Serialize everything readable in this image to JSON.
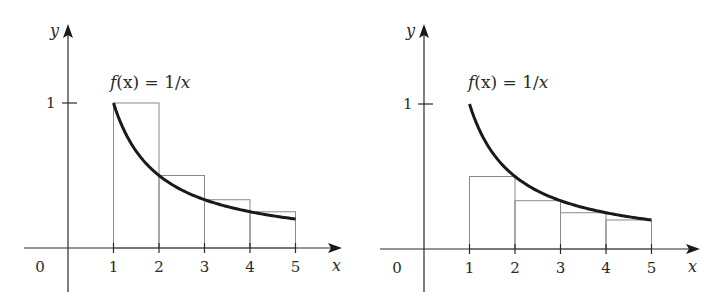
{
  "chart_data": [
    {
      "type": "line",
      "title": "",
      "function_label": "f(x) = 1/x",
      "function_label_parts": {
        "f": "f",
        "arg": "(x)",
        "eq": " = ",
        "rhs_num": "1/",
        "rhs_var": "x"
      },
      "xlabel": "x",
      "ylabel": "y",
      "x_ticks": [
        "0",
        "1",
        "2",
        "3",
        "4",
        "5"
      ],
      "y_ticks": [
        "1"
      ],
      "xlim": [
        -0.5,
        5.8
      ],
      "ylim": [
        -0.3,
        1.35
      ],
      "grid": false,
      "series": [
        {
          "name": "f(x) = 1/x",
          "x": [
            1,
            1.5,
            2,
            2.5,
            3,
            3.5,
            4,
            4.5,
            5
          ],
          "y": [
            1,
            0.667,
            0.5,
            0.4,
            0.333,
            0.286,
            0.25,
            0.222,
            0.2
          ]
        }
      ],
      "rectangles": {
        "description": "Left-endpoint rectangles (overestimate)",
        "intervals": [
          [
            1,
            2
          ],
          [
            2,
            3
          ],
          [
            3,
            4
          ],
          [
            4,
            5
          ]
        ],
        "heights": [
          1,
          0.5,
          0.333,
          0.25
        ]
      }
    },
    {
      "type": "line",
      "title": "",
      "function_label": "f(x) = 1/x",
      "function_label_parts": {
        "f": "f",
        "arg": "(x)",
        "eq": " = ",
        "rhs_num": "1/",
        "rhs_var": "x"
      },
      "xlabel": "x",
      "ylabel": "y",
      "x_ticks": [
        "0",
        "1",
        "2",
        "3",
        "4",
        "5"
      ],
      "y_ticks": [
        "1"
      ],
      "xlim": [
        -0.5,
        5.8
      ],
      "ylim": [
        -0.3,
        1.35
      ],
      "grid": false,
      "series": [
        {
          "name": "f(x) = 1/x",
          "x": [
            1,
            1.5,
            2,
            2.5,
            3,
            3.5,
            4,
            4.5,
            5
          ],
          "y": [
            1,
            0.667,
            0.5,
            0.4,
            0.333,
            0.286,
            0.25,
            0.222,
            0.2
          ]
        }
      ],
      "rectangles": {
        "description": "Right-endpoint rectangles (underestimate)",
        "intervals": [
          [
            1,
            2
          ],
          [
            2,
            3
          ],
          [
            3,
            4
          ],
          [
            4,
            5
          ]
        ],
        "heights": [
          0.5,
          0.333,
          0.25,
          0.2
        ]
      }
    }
  ],
  "colors": {
    "curve": "#1a1a1a",
    "axis": "#2a2a2a",
    "rect": "#8a8a8a"
  }
}
